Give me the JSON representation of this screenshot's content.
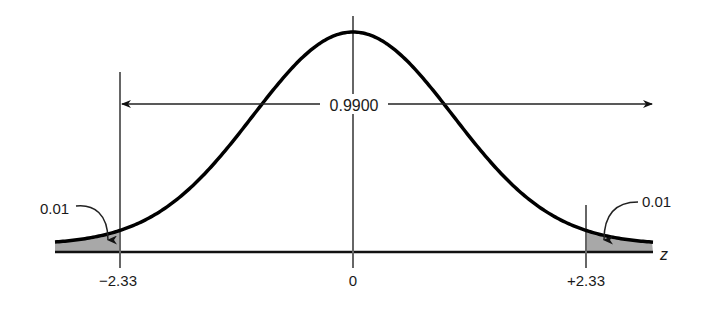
{
  "chart_data": {
    "type": "area",
    "title": "",
    "xlabel": "z",
    "ylabel": "",
    "x_ticks": [
      "−2.33",
      "0",
      "+2.33"
    ],
    "x_tick_values": [
      -2.33,
      0,
      2.33
    ],
    "center_area_label": "0.9900",
    "center_area": 0.99,
    "tail_areas": [
      {
        "side": "left",
        "label": "0.01",
        "value": 0.01,
        "boundary": -2.33
      },
      {
        "side": "right",
        "label": "0.01",
        "value": 0.01,
        "boundary": 2.33
      }
    ],
    "xlim": [
      -3.0,
      3.0
    ],
    "grid": false,
    "colors": {
      "curve": "#000000",
      "shade": "#a8a8a8",
      "lines": "#555555"
    }
  }
}
